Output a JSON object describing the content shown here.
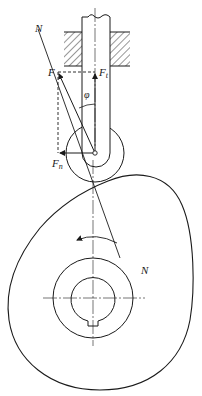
{
  "figure": {
    "labels": {
      "normal_top": "N",
      "normal_bottom": "N",
      "force": "F",
      "force_t_main": "F",
      "force_t_sub": "t",
      "force_n_main": "F",
      "force_n_sub": "n",
      "pressure_angle": "φ"
    },
    "colors": {
      "line": "#1a1a1a",
      "background": "#ffffff"
    }
  }
}
